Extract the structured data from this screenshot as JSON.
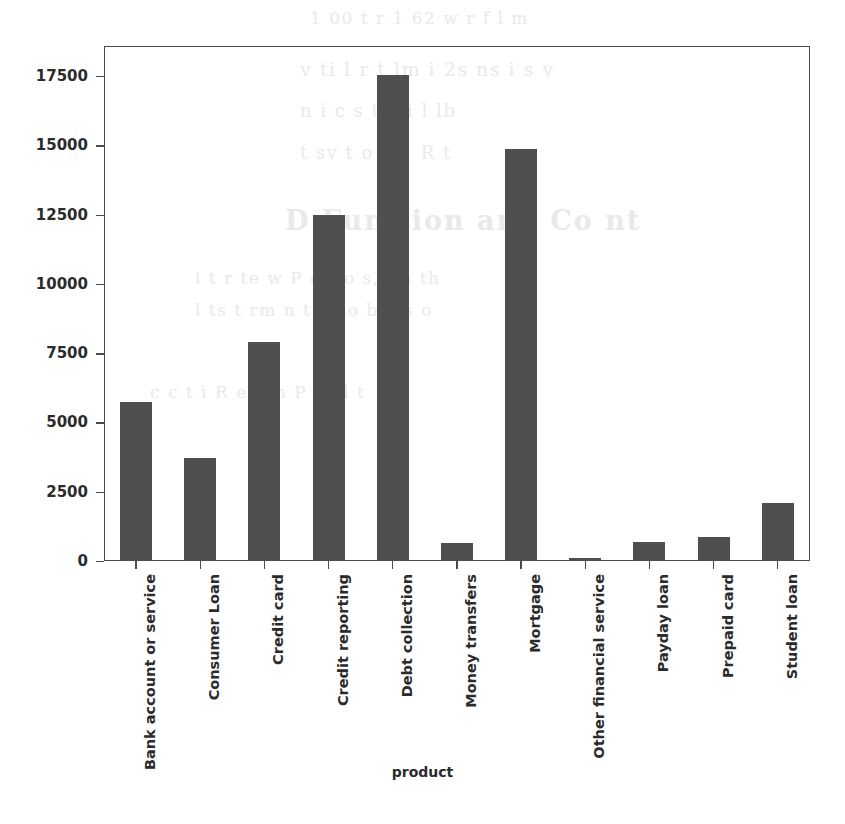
{
  "chart_data": {
    "type": "bar",
    "title": "",
    "xlabel": "product",
    "ylabel": "",
    "categories": [
      "Bank account or service",
      "Consumer Loan",
      "Credit card",
      "Credit reporting",
      "Debt collection",
      "Money transfers",
      "Mortgage",
      "Other financial service",
      "Payday loan",
      "Prepaid card",
      "Student loan"
    ],
    "values": [
      5750,
      3700,
      7900,
      12500,
      17550,
      650,
      14850,
      110,
      700,
      870,
      2100
    ],
    "ylim": [
      0,
      18550
    ],
    "yticks": [
      0,
      2500,
      5000,
      7500,
      10000,
      12500,
      15000,
      17500
    ],
    "ytick_labels": [
      "0",
      "2500",
      "5000",
      "7500",
      "10000",
      "12500",
      "15000",
      "17500"
    ],
    "grid": false,
    "legend": null,
    "bar_color": "#4f4f4f",
    "axis_color": "#4a4a4a"
  },
  "background_text": {
    "note": "illegible faint scanned-page bleed-through",
    "lines": [
      "1 00 t  r 1 62    w       r   f  l  m",
      "v ti l  r  t lm i  2s  ns   i  s v",
      "n  i    c  s  t  o  i  l        lb",
      "t   sv  t o  o  1      R           t",
      "D  Fun tion  and Co   nt",
      "i  t  r  te   w  P  e  t o s,     i n  th",
      "l  ts  t  rm  n  t  p  so  bl   es       o",
      "c  c   t  i  R  e  t  m  P  i  t  l  t"
    ]
  }
}
